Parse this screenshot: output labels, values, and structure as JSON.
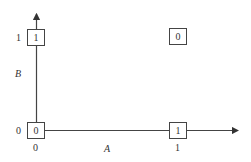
{
  "diagram": {
    "axes": {
      "x_label": "A",
      "y_label": "B",
      "x_ticks": [
        "0",
        "1"
      ],
      "y_ticks": [
        "0",
        "1"
      ]
    },
    "cells": [
      {
        "a": "0",
        "b": "0",
        "value": "0"
      },
      {
        "a": "1",
        "b": "0",
        "value": "1"
      },
      {
        "a": "0",
        "b": "1",
        "value": "1"
      },
      {
        "a": "1",
        "b": "1",
        "value": "0"
      }
    ],
    "colors": {
      "line": "#444444",
      "text": "#333333"
    }
  }
}
